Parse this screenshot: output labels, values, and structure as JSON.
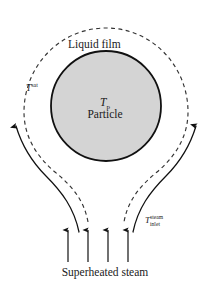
{
  "figure": {
    "title_none": "",
    "width": 210,
    "height": 290,
    "background_color": "#ffffff"
  },
  "colors": {
    "particle_fill": "#d4d4d4",
    "particle_stroke": "#111111",
    "film_boundary_stroke": "#333333",
    "flow_arrow_stroke": "#111111",
    "inlet_arrow_stroke": "#111111",
    "text": "#1a1a1a"
  },
  "labels": {
    "liquid_film": "Liquid film",
    "t_sat_symbol": "T",
    "t_sat_superscript": "sat",
    "t_particle_symbol": "T",
    "t_particle_subscript": "p",
    "particle": "Particle",
    "t_inlet_symbol": "T",
    "t_inlet_superscript": "steam",
    "t_inlet_subscript": "inlet",
    "superheated_steam": "Superheated steam"
  },
  "geometry": {
    "particle_center_x": 106,
    "particle_center_y": 106,
    "particle_radius": 55,
    "inlet_arrow_x_positions": [
      68,
      88,
      108,
      128
    ],
    "inlet_arrow_top_y": 228,
    "inlet_arrow_bottom_y": 262
  },
  "elements": {
    "particle_sphere": "particle-sphere",
    "liquid_film_boundary": "liquid-film-boundary-dashed",
    "left_vapor_flow_arrow": "vapor-flow-arrow-left",
    "right_vapor_flow_arrow": "vapor-flow-arrow-right",
    "inlet_steam_arrows": "inlet-steam-arrows"
  }
}
